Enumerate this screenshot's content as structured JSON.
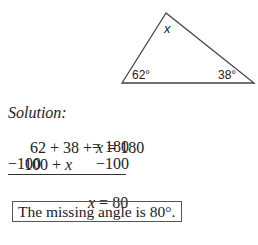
{
  "figure": {
    "type": "triangle",
    "vertices": {
      "top": [
        166,
        13
      ],
      "bottom_left": [
        122,
        83
      ],
      "bottom_right": [
        254,
        83
      ]
    },
    "angle_labels": {
      "top": "x",
      "bottom_left": "62°",
      "bottom_right": "38°"
    }
  },
  "solution": {
    "heading": "Solution:",
    "lines": [
      {
        "left": "62 + 38 + ",
        "var": "x",
        "right": " = 180"
      },
      {
        "left": "100 + ",
        "var": "x",
        "right": "= 180"
      },
      {
        "left": "−100",
        "right": "−100"
      }
    ],
    "result": {
      "var": "x",
      "right": " = 80"
    }
  },
  "answer": "The missing angle is 80°."
}
